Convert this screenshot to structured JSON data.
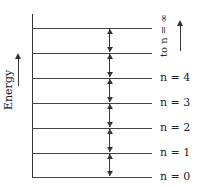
{
  "diagram": {
    "y_axis_label": "Energy",
    "top_label": "to n = ∞",
    "levels": [
      {
        "label": "n = 4"
      },
      {
        "label": "n = 3"
      },
      {
        "label": "n = 2"
      },
      {
        "label": "n = 1"
      },
      {
        "label": "n = 0"
      }
    ],
    "level_count_total": 7,
    "level_y_positions": [
      28,
      53,
      78,
      103,
      128,
      153,
      177
    ],
    "transitions": "double-headed arrows between each adjacent level (equal spacing)"
  }
}
